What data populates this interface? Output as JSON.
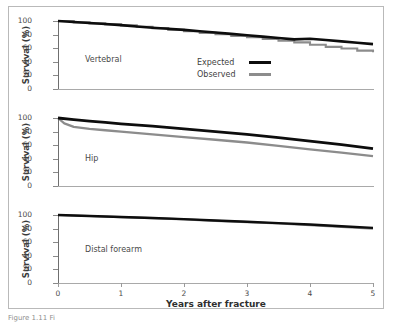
{
  "figure": {
    "caption": "Figure 1.11 Fi",
    "xtitle": "Years after fracture",
    "ytitle": "Survival (%)",
    "yticks": [
      "0",
      "20",
      "40",
      "60",
      "80",
      "100"
    ],
    "xticks": [
      "0",
      "1",
      "2",
      "3",
      "4",
      "5"
    ],
    "colors": {
      "expected": "#0d0d0d",
      "observed": "#8c8c8c",
      "axis": "#7a7a7a",
      "frame": "#b9b9b9",
      "text": "#3b3b3b"
    }
  },
  "legend": {
    "position": "inside-top-panel",
    "entries": [
      {
        "label": "Expected",
        "icon": "thick-black-line-swatch"
      },
      {
        "label": "Observed",
        "icon": "thin-gray-line-swatch"
      }
    ]
  },
  "chart_data": [
    {
      "type": "line",
      "title": "Vertebral",
      "xlabel": "Years after fracture",
      "ylabel": "Survival (%)",
      "xlim": [
        0,
        5
      ],
      "ylim": [
        0,
        100
      ],
      "grid": false,
      "categories": [
        "0",
        "1",
        "2",
        "3",
        "4",
        "5"
      ],
      "series": [
        {
          "name": "Expected",
          "x": [
            0,
            0.25,
            0.5,
            0.75,
            1,
            1.25,
            1.5,
            1.75,
            2,
            2.25,
            2.5,
            2.75,
            3,
            3.25,
            3.5,
            3.75,
            4,
            4.25,
            4.5,
            4.75,
            5
          ],
          "values": [
            100,
            98.5,
            97,
            95.5,
            94,
            92,
            90,
            88.5,
            87,
            85,
            83,
            81,
            79,
            77,
            75,
            73,
            74,
            72,
            70,
            68,
            66
          ]
        },
        {
          "name": "Observed",
          "x": [
            0,
            0.25,
            0.5,
            0.75,
            1,
            1.25,
            1.5,
            1.75,
            2,
            2.25,
            2.5,
            2.75,
            3,
            3.25,
            3.5,
            3.75,
            4,
            4.25,
            4.5,
            4.75,
            5
          ],
          "values": [
            100,
            98,
            96.5,
            95,
            93.5,
            91.5,
            89.5,
            87,
            85,
            82.5,
            80.5,
            78,
            76,
            73.5,
            71,
            68.5,
            65,
            62,
            59.5,
            56.5,
            54
          ]
        }
      ]
    },
    {
      "type": "line",
      "title": "Hip",
      "xlabel": "Years after fracture",
      "ylabel": "Survival (%)",
      "xlim": [
        0,
        5
      ],
      "ylim": [
        0,
        100
      ],
      "grid": false,
      "categories": [
        "0",
        "1",
        "2",
        "3",
        "4",
        "5"
      ],
      "series": [
        {
          "name": "Expected",
          "x": [
            0,
            0.25,
            0.5,
            0.75,
            1,
            1.5,
            2,
            2.5,
            3,
            3.5,
            4,
            4.5,
            5
          ],
          "values": [
            100,
            97.5,
            95.5,
            93.5,
            91.5,
            88,
            84,
            80,
            76,
            71,
            66,
            61,
            55
          ]
        },
        {
          "name": "Observed",
          "x": [
            0,
            0.1,
            0.25,
            0.5,
            0.75,
            1,
            1.5,
            2,
            2.5,
            3,
            3.5,
            4,
            4.5,
            5
          ],
          "values": [
            100,
            92,
            87,
            84,
            82,
            80,
            76,
            72,
            68,
            64,
            59,
            54,
            49,
            44
          ]
        }
      ]
    },
    {
      "type": "line",
      "title": "Distal forearm",
      "xlabel": "Years after fracture",
      "ylabel": "Survival (%)",
      "xlim": [
        0,
        5
      ],
      "ylim": [
        0,
        100
      ],
      "grid": false,
      "categories": [
        "0",
        "1",
        "2",
        "3",
        "4",
        "5"
      ],
      "series": [
        {
          "name": "Expected",
          "x": [
            0,
            0.5,
            1,
            1.5,
            2,
            2.5,
            3,
            3.5,
            4,
            4.5,
            5
          ],
          "values": [
            100,
            98.5,
            97,
            95.5,
            94,
            92,
            90,
            88,
            86,
            83.5,
            81
          ]
        },
        {
          "name": "Observed",
          "x": [
            0,
            0.5,
            1,
            1.5,
            2,
            2.5,
            3,
            3.5,
            4,
            4.5,
            5
          ],
          "values": [
            100,
            98.5,
            97,
            95.5,
            93.5,
            91.5,
            89.5,
            87.5,
            85,
            82.5,
            80
          ]
        }
      ]
    }
  ]
}
